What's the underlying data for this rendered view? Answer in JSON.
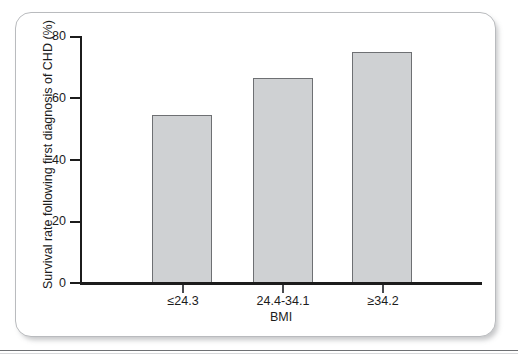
{
  "figure": {
    "panel_border_color": "#b9bbbe",
    "background_color": "#ffffff"
  },
  "chart_data": {
    "type": "bar",
    "title": "",
    "categories": [
      "≤24.3",
      "24.4-34.1",
      "≥34.2"
    ],
    "values": [
      54.5,
      66.3,
      75.0
    ],
    "series": [
      {
        "name": "Survival rate following first diagnosis of CHD (%)",
        "values": [
          54.5,
          66.3,
          75.0
        ]
      }
    ],
    "xlabel": "BMI",
    "ylabel": "Survival rate following first diagnosis of CHD (%)",
    "ylim": [
      0,
      80
    ],
    "yticks": [
      0,
      20,
      40,
      60,
      80
    ],
    "ytick_labels": [
      "0",
      "20",
      "40",
      "60",
      "80"
    ],
    "grid": false,
    "legend": false,
    "bar_fill_color": "#cfd1d3",
    "bar_edge_color": "#6e7073",
    "axis_color": "#1c1c1c"
  }
}
